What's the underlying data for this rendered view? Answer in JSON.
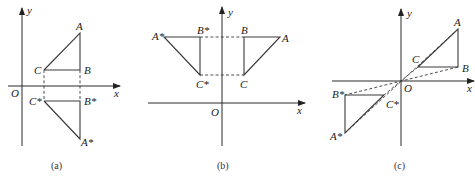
{
  "figure": {
    "panels": [
      {
        "id": "a",
        "caption": "(a)",
        "description": "Reflection of triangle ABC across the x-axis",
        "axes": {
          "x_label": "x",
          "y_label": "y",
          "origin_label": "O"
        },
        "points": {
          "A": {
            "label": "A",
            "px": [
              80,
              33
            ]
          },
          "B": {
            "label": "B",
            "px": [
              80,
              70
            ]
          },
          "C": {
            "label": "C",
            "px": [
              44,
              70
            ]
          },
          "A*": {
            "label": "A*",
            "px": [
              80,
              139
            ]
          },
          "B*": {
            "label": "B*",
            "px": [
              80,
              101
            ]
          },
          "C*": {
            "label": "C*",
            "px": [
              44,
              101
            ]
          }
        }
      },
      {
        "id": "b",
        "caption": "(b)",
        "description": "Reflection of triangle ABC across the y-axis",
        "axes": {
          "x_label": "x",
          "y_label": "y",
          "origin_label": "O"
        },
        "points": {
          "A": {
            "label": "A",
            "px": [
              280,
              37
            ]
          },
          "B": {
            "label": "B",
            "px": [
              244,
              37
            ]
          },
          "C": {
            "label": "C",
            "px": [
              244,
              75
            ]
          },
          "A*": {
            "label": "A*",
            "px": [
              164,
              37
            ]
          },
          "B*": {
            "label": "B*",
            "px": [
              200,
              37
            ]
          },
          "C*": {
            "label": "C*",
            "px": [
              200,
              75
            ]
          }
        }
      },
      {
        "id": "c",
        "caption": "(c)",
        "description": "Reflection of triangle ABC through the origin O",
        "axes": {
          "x_label": "x",
          "y_label": "y",
          "origin_label": "O"
        },
        "points": {
          "A": {
            "label": "A",
            "px": [
              458,
              29
            ]
          },
          "B": {
            "label": "B",
            "px": [
              458,
              67
            ]
          },
          "C": {
            "label": "C",
            "px": [
              418,
              67
            ]
          },
          "A*": {
            "label": "A*",
            "px": [
              345,
              133
            ]
          },
          "B*": {
            "label": "B*",
            "px": [
              345,
              95
            ]
          },
          "C*": {
            "label": "C*",
            "px": [
              384,
              95
            ]
          }
        }
      }
    ]
  },
  "labels": {
    "a": {
      "y": "y",
      "x": "x",
      "o": "O",
      "A": "A",
      "B": "B",
      "C": "C",
      "As": "A*",
      "Bs": "B*",
      "Cs": "C*",
      "caption": "(a)"
    },
    "b": {
      "y": "y",
      "x": "x",
      "o": "O",
      "A": "A",
      "B": "B",
      "C": "C",
      "As": "A*",
      "Bs": "B*",
      "Cs": "C*",
      "caption": "(b)"
    },
    "c": {
      "y": "y",
      "x": "x",
      "o": "O",
      "A": "A",
      "B": "B",
      "C": "C",
      "As": "A*",
      "Bs": "B*",
      "Cs": "C*",
      "caption": "(c)"
    }
  },
  "colors": {
    "line": "#3a3a3a",
    "text": "#222222",
    "background": "#ffffff"
  }
}
